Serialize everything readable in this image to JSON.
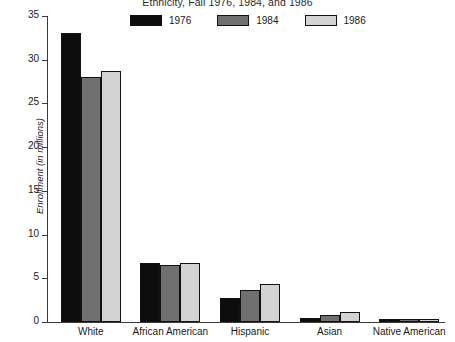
{
  "chart_data": {
    "type": "bar",
    "title": "Ethnicity, Fall 1976, 1984, and 1986",
    "xlabel": "",
    "ylabel": "Enrollment (in millions)",
    "ylim": [
      0,
      35
    ],
    "yticks": [
      0,
      5,
      10,
      15,
      20,
      25,
      30,
      35
    ],
    "ytick_labels": [
      "0",
      "5",
      "10",
      "15",
      "20",
      "25",
      "30",
      "35"
    ],
    "grid": false,
    "legend_position": "top-center",
    "categories": [
      "White",
      "African American",
      "Hispanic",
      "Asian",
      "Native American"
    ],
    "series": [
      {
        "name": "1976",
        "color": "#0d0d0d",
        "values": [
          33.1,
          6.8,
          2.8,
          0.5,
          0.3
        ]
      },
      {
        "name": "1984",
        "color": "#707070",
        "values": [
          28.0,
          6.5,
          3.7,
          0.8,
          0.4
        ]
      },
      {
        "name": "1986",
        "color": "#d3d3d3",
        "values": [
          28.7,
          6.7,
          4.3,
          1.1,
          0.4
        ]
      }
    ]
  },
  "colors": {
    "axis": "#3a3a3a",
    "text": "#1a1a1a",
    "background": "#ffffff",
    "bar_border": "#111111"
  }
}
